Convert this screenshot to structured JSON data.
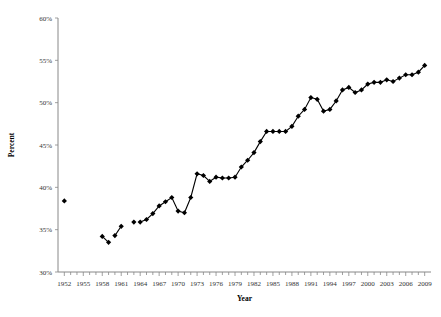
{
  "chart_data": {
    "type": "line",
    "title": "",
    "xlabel": "Year",
    "ylabel": "Percent",
    "xlim": [
      1951,
      2010
    ],
    "ylim": [
      30,
      60
    ],
    "ytick_labels": [
      "60%",
      "55%",
      "50%",
      "45%",
      "40%",
      "35%",
      "30%"
    ],
    "ytick_values": [
      60,
      55,
      50,
      45,
      40,
      35,
      30
    ],
    "xtick_labels": [
      "1952",
      "1955",
      "1958",
      "1961",
      "1964",
      "1967",
      "1970",
      "1973",
      "1976",
      "1979",
      "1982",
      "1985",
      "1988",
      "1991",
      "1994",
      "1997",
      "2000",
      "2003",
      "2006",
      "2009"
    ],
    "xtick_values": [
      1952,
      1955,
      1958,
      1961,
      1964,
      1967,
      1970,
      1973,
      1976,
      1979,
      1982,
      1985,
      1988,
      1991,
      1994,
      1997,
      2000,
      2003,
      2006,
      2009
    ],
    "grid": false,
    "legend": false,
    "marker": "diamond",
    "marker_color": "#000000",
    "line_color": "#000000",
    "segments": [
      {
        "name": "1952",
        "points": [
          {
            "x": 1952,
            "y": 38.4
          }
        ]
      },
      {
        "name": "1958-1959",
        "points": [
          {
            "x": 1958,
            "y": 34.2
          },
          {
            "x": 1959,
            "y": 33.5
          }
        ]
      },
      {
        "name": "1960-1961",
        "points": [
          {
            "x": 1960,
            "y": 34.3
          },
          {
            "x": 1961,
            "y": 35.4
          }
        ]
      },
      {
        "name": "1963",
        "points": [
          {
            "x": 1963,
            "y": 35.9
          }
        ]
      },
      {
        "name": "1964-2009",
        "points": [
          {
            "x": 1964,
            "y": 35.9
          },
          {
            "x": 1965,
            "y": 36.2
          },
          {
            "x": 1966,
            "y": 36.9
          },
          {
            "x": 1967,
            "y": 37.8
          },
          {
            "x": 1968,
            "y": 38.3
          },
          {
            "x": 1969,
            "y": 38.8
          },
          {
            "x": 1970,
            "y": 37.2
          },
          {
            "x": 1971,
            "y": 37.0
          },
          {
            "x": 1972,
            "y": 38.8
          },
          {
            "x": 1973,
            "y": 41.6
          },
          {
            "x": 1974,
            "y": 41.4
          },
          {
            "x": 1975,
            "y": 40.7
          },
          {
            "x": 1976,
            "y": 41.2
          },
          {
            "x": 1977,
            "y": 41.1
          },
          {
            "x": 1978,
            "y": 41.1
          },
          {
            "x": 1979,
            "y": 41.2
          },
          {
            "x": 1980,
            "y": 42.4
          },
          {
            "x": 1981,
            "y": 43.2
          },
          {
            "x": 1982,
            "y": 44.1
          },
          {
            "x": 1983,
            "y": 45.4
          },
          {
            "x": 1984,
            "y": 46.6
          },
          {
            "x": 1985,
            "y": 46.6
          },
          {
            "x": 1986,
            "y": 46.6
          },
          {
            "x": 1987,
            "y": 46.6
          },
          {
            "x": 1988,
            "y": 47.2
          },
          {
            "x": 1989,
            "y": 48.4
          },
          {
            "x": 1990,
            "y": 49.2
          },
          {
            "x": 1991,
            "y": 50.6
          },
          {
            "x": 1992,
            "y": 50.4
          },
          {
            "x": 1993,
            "y": 49.0
          },
          {
            "x": 1994,
            "y": 49.2
          },
          {
            "x": 1995,
            "y": 50.2
          },
          {
            "x": 1996,
            "y": 51.5
          },
          {
            "x": 1997,
            "y": 51.8
          },
          {
            "x": 1998,
            "y": 51.2
          },
          {
            "x": 1999,
            "y": 51.5
          },
          {
            "x": 2000,
            "y": 52.2
          },
          {
            "x": 2001,
            "y": 52.4
          },
          {
            "x": 2002,
            "y": 52.4
          },
          {
            "x": 2003,
            "y": 52.7
          },
          {
            "x": 2004,
            "y": 52.5
          },
          {
            "x": 2005,
            "y": 52.9
          },
          {
            "x": 2006,
            "y": 53.3
          },
          {
            "x": 2007,
            "y": 53.3
          },
          {
            "x": 2008,
            "y": 53.6
          },
          {
            "x": 2009,
            "y": 54.4
          }
        ]
      }
    ]
  }
}
